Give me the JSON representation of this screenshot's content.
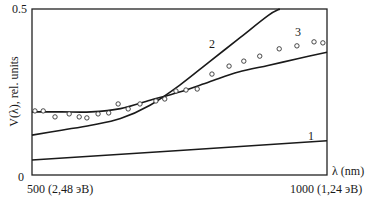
{
  "chart_data": {
    "type": "line",
    "title": "",
    "xlabel": "λ (nm)",
    "ylabel": "V(λ), rel. units",
    "xlim": [
      500,
      1000
    ],
    "ylim": [
      0,
      0.5
    ],
    "x_tick_labels": [
      "500 (2,48 эВ)",
      "1000 (1,24 эВ)"
    ],
    "y_tick_labels": [
      "0",
      "0.5"
    ],
    "grid": false,
    "legend": "inline curve numbers",
    "series": [
      {
        "name": "1",
        "style": "line",
        "x": [
          500,
          1000
        ],
        "y": [
          0.045,
          0.103
        ]
      },
      {
        "name": "2",
        "style": "line",
        "x": [
          500,
          550,
          600,
          650,
          700,
          750,
          800,
          850,
          900,
          920
        ],
        "y": [
          0.12,
          0.135,
          0.15,
          0.17,
          0.21,
          0.27,
          0.34,
          0.41,
          0.48,
          0.5
        ]
      },
      {
        "name": "3",
        "style": "line",
        "x": [
          500,
          550,
          600,
          650,
          700,
          750,
          800,
          850,
          900,
          950,
          1000
        ],
        "y": [
          0.19,
          0.19,
          0.19,
          0.2,
          0.225,
          0.25,
          0.28,
          0.31,
          0.33,
          0.35,
          0.37
        ]
      },
      {
        "name": "experiment",
        "style": "markers",
        "x": [
          505,
          519,
          539,
          563,
          580,
          593,
          612,
          630,
          646,
          663,
          683,
          710,
          725,
          744,
          761,
          780,
          805,
          834,
          859,
          886,
          919,
          949,
          978,
          993
        ],
        "y": [
          0.193,
          0.193,
          0.175,
          0.184,
          0.175,
          0.172,
          0.184,
          0.187,
          0.214,
          0.199,
          0.214,
          0.223,
          0.229,
          0.253,
          0.256,
          0.259,
          0.304,
          0.328,
          0.343,
          0.358,
          0.38,
          0.389,
          0.401,
          0.398
        ]
      }
    ],
    "annotations": [
      {
        "text": "1",
        "x": 975,
        "y": 0.12
      },
      {
        "text": "2",
        "x": 790,
        "y": 0.4
      },
      {
        "text": "3",
        "x": 960,
        "y": 0.43
      }
    ]
  },
  "labels": {
    "y_top": "0.5",
    "y_bottom": "0",
    "x_left": "500 (2,48 эВ)",
    "x_right": "1000 (1,24 эВ)",
    "x_unit": "λ (nm)",
    "y_axis": "V(λ), rel. units",
    "curve1": "1",
    "curve2": "2",
    "curve3": "3"
  }
}
